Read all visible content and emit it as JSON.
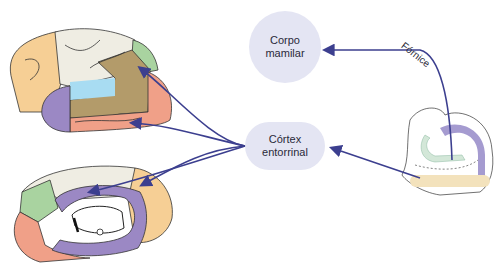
{
  "nodes": {
    "mammillary": {
      "line1": "Corpo",
      "line2": "mamilar"
    },
    "entorhinal": {
      "line1": "Córtex",
      "line2": "entorrinal"
    }
  },
  "labels": {
    "fornix": "Fórnice"
  },
  "colors": {
    "node_fill": "#e4e5f3",
    "arrow": "#3c3f8f",
    "orange": "#f6cf95",
    "cream": "#efede3",
    "green": "#a9d3a0",
    "olive": "#b39b6a",
    "salmon": "#f0a088",
    "purple": "#9b88c4",
    "blue": "#a8dcf2",
    "hippo_beige": "#f3e2bc",
    "hippo_green": "#d3e7d8",
    "hippo_purple": "#a59bd0"
  },
  "figures": [
    "lateral-brain",
    "medial-brain",
    "hippocampus-section"
  ]
}
